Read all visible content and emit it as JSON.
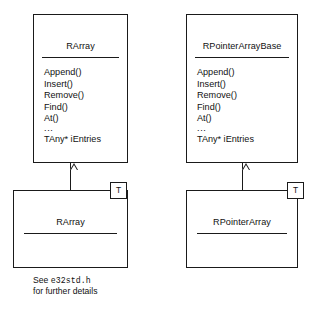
{
  "diagram": {
    "type": "uml-class-diagram",
    "colors": {
      "background": "#ffffff",
      "stroke": "#1a1a1a",
      "text": "#111111"
    },
    "base_classes": [
      {
        "name": "RArray",
        "members": [
          "Append()",
          "Insert()",
          "Remove()",
          "Find()",
          "At()",
          "...",
          "TAny* iEntries"
        ]
      },
      {
        "name": "RPointerArrayBase",
        "members": [
          "Append()",
          "Insert()",
          "Remove()",
          "Find()",
          "At()",
          "...",
          "TAny* iEntries"
        ]
      }
    ],
    "template_classes": [
      {
        "name": "RArray",
        "template_parameter": "T"
      },
      {
        "name": "RPointerArray",
        "template_parameter": "T"
      }
    ],
    "caption": {
      "line1_prefix": "See ",
      "line1_code": "e32std.h",
      "line2": "for further details"
    },
    "relationships": [
      {
        "kind": "generalization",
        "from": "RArray<T>",
        "to": "RArray"
      },
      {
        "kind": "generalization",
        "from": "RPointerArray<T>",
        "to": "RPointerArrayBase"
      }
    ]
  }
}
